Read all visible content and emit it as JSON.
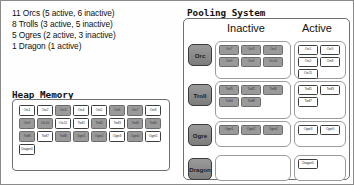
{
  "summary": {
    "lines": [
      "11 Orcs (5 active, 6 inactive)",
      "8 Trolls (3 active, 5 inactive)",
      "5 Ogres (2 active, 3 inactive)",
      "1 Dragon (1 active)"
    ]
  },
  "heap": {
    "title": "Heap Memory",
    "cells": [
      {
        "label": "Orc1",
        "state": "active"
      },
      {
        "label": "Orc2",
        "state": "active"
      },
      {
        "label": "Orc3",
        "state": "inactive"
      },
      {
        "label": "Orc4",
        "state": "active"
      },
      {
        "label": "Orc5",
        "state": "active"
      },
      {
        "label": "Orc6",
        "state": "inactive"
      },
      {
        "label": "Orc7",
        "state": "inactive"
      },
      {
        "label": "Orc8",
        "state": "active"
      },
      {
        "label": "Orc9",
        "state": "inactive"
      },
      {
        "label": "Orc10",
        "state": "inactive"
      },
      {
        "label": "Orc11",
        "state": "active"
      },
      {
        "label": "Troll1",
        "state": "active"
      },
      {
        "label": "Troll2",
        "state": "inactive"
      },
      {
        "label": "Troll3",
        "state": "active"
      },
      {
        "label": "Troll4",
        "state": "inactive"
      },
      {
        "label": "Troll5",
        "state": "inactive"
      },
      {
        "label": "Troll6",
        "state": "inactive"
      },
      {
        "label": "Troll7",
        "state": "active"
      },
      {
        "label": "Troll8",
        "state": "inactive"
      },
      {
        "label": "Ogre1",
        "state": "inactive"
      },
      {
        "label": "Ogre2",
        "state": "inactive"
      },
      {
        "label": "Ogre3",
        "state": "active"
      },
      {
        "label": "Ogre4",
        "state": "inactive"
      },
      {
        "label": "Ogre5",
        "state": "active"
      },
      {
        "label": "Dragon1",
        "state": "active"
      }
    ]
  },
  "pool": {
    "title": "Pooling System",
    "columns": {
      "inactive": "Inactive",
      "active": "Active"
    },
    "rows": [
      {
        "type": "Orc",
        "inactive": [
          "Orc7",
          "Orc3",
          "Orc4",
          "Orc9",
          "Orc6",
          "Orc10"
        ],
        "active": [
          "Orc1",
          "Orc5",
          "Orc2",
          "Orc8",
          "Orc11"
        ]
      },
      {
        "type": "Troll",
        "inactive": [
          "Troll5",
          "Troll2",
          "Troll6",
          "Troll4",
          "Troll8"
        ],
        "active": [
          "Troll1",
          "Troll3",
          "Troll7"
        ]
      },
      {
        "type": "Ogre",
        "inactive": [
          "Ogre1",
          "Ogre2",
          "Ogre4"
        ],
        "active": [
          "Ogre3",
          "Ogre5"
        ]
      },
      {
        "type": "Dragon",
        "inactive": [],
        "active": [
          "Dragon1"
        ]
      }
    ]
  },
  "colors": {
    "inactive_fill": "#9a9a9a",
    "active_fill": "#ffffff",
    "border": "#6f6f6f",
    "button": "#8c8c8c"
  }
}
